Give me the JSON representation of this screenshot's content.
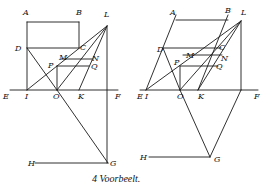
{
  "caption": "4 Voorbeelt.",
  "figures": [
    {
      "name": "left-figure",
      "lines": [
        [
          27,
          22,
          79,
          22
        ],
        [
          27,
          22,
          27,
          90
        ],
        [
          79,
          22,
          79,
          48
        ],
        [
          27,
          48,
          79,
          48
        ],
        [
          10,
          90,
          118,
          90
        ],
        [
          27,
          48,
          57,
          90
        ],
        [
          27,
          90,
          107,
          26
        ],
        [
          79,
          90,
          107,
          26
        ],
        [
          57,
          90,
          107,
          26
        ],
        [
          107,
          26,
          107,
          163
        ],
        [
          57,
          90,
          108,
          163
        ],
        [
          35,
          163,
          108,
          163
        ],
        [
          61,
          59,
          92,
          59
        ],
        [
          57,
          66,
          89,
          66
        ],
        [
          57,
          66,
          57,
          90
        ]
      ],
      "labels": [
        {
          "t": "A",
          "x": 23,
          "y": 15
        },
        {
          "t": "B",
          "x": 76,
          "y": 15
        },
        {
          "t": "L",
          "x": 104,
          "y": 17
        },
        {
          "t": "D",
          "x": 15,
          "y": 51
        },
        {
          "t": "C",
          "x": 80,
          "y": 50
        },
        {
          "t": "M",
          "x": 59,
          "y": 60
        },
        {
          "t": "N",
          "x": 92,
          "y": 61
        },
        {
          "t": "P",
          "x": 48,
          "y": 68
        },
        {
          "t": "Q",
          "x": 91,
          "y": 69
        },
        {
          "t": "E",
          "x": 3,
          "y": 99
        },
        {
          "t": "I",
          "x": 25,
          "y": 99
        },
        {
          "t": "O",
          "x": 53,
          "y": 99
        },
        {
          "t": "K",
          "x": 78,
          "y": 99
        },
        {
          "t": "F",
          "x": 115,
          "y": 99
        },
        {
          "t": "H",
          "x": 28,
          "y": 166
        },
        {
          "t": "G",
          "x": 110,
          "y": 166
        }
      ]
    },
    {
      "name": "right-figure",
      "lines": [
        [
          176,
          20,
          228,
          20
        ],
        [
          146,
          90,
          176,
          15
        ],
        [
          228,
          15,
          198,
          90
        ],
        [
          163,
          48,
          221,
          48
        ],
        [
          140,
          90,
          258,
          90
        ],
        [
          163,
          48,
          180,
          90
        ],
        [
          146,
          90,
          241,
          21
        ],
        [
          198,
          90,
          241,
          21
        ],
        [
          180,
          90,
          241,
          21
        ],
        [
          241,
          21,
          241,
          90
        ],
        [
          180,
          90,
          210,
          157
        ],
        [
          241,
          90,
          210,
          157
        ],
        [
          149,
          157,
          210,
          157
        ],
        [
          183,
          55,
          222,
          55
        ],
        [
          180,
          66,
          218,
          66
        ],
        [
          180,
          66,
          180,
          90
        ]
      ],
      "labels": [
        {
          "t": "A",
          "x": 170,
          "y": 15
        },
        {
          "t": "B",
          "x": 225,
          "y": 13
        },
        {
          "t": "L",
          "x": 241,
          "y": 15
        },
        {
          "t": "D",
          "x": 157,
          "y": 52
        },
        {
          "t": "C",
          "x": 219,
          "y": 50
        },
        {
          "t": "M",
          "x": 186,
          "y": 58
        },
        {
          "t": "N",
          "x": 221,
          "y": 61
        },
        {
          "t": "P",
          "x": 174,
          "y": 65
        },
        {
          "t": "Q",
          "x": 216,
          "y": 69
        },
        {
          "t": "E",
          "x": 137,
          "y": 99
        },
        {
          "t": "I",
          "x": 145,
          "y": 99
        },
        {
          "t": "O",
          "x": 177,
          "y": 99
        },
        {
          "t": "K",
          "x": 198,
          "y": 99
        },
        {
          "t": "F",
          "x": 254,
          "y": 99
        },
        {
          "t": "H",
          "x": 140,
          "y": 160
        },
        {
          "t": "G",
          "x": 214,
          "y": 162
        }
      ]
    }
  ]
}
